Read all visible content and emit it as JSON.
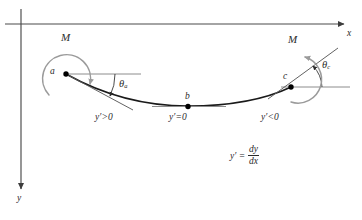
{
  "figure": {
    "background_color": "#ffffff",
    "width": 362,
    "height": 220
  },
  "colors": {
    "axis": "#4a4a4a",
    "curve": "#1a1a1a",
    "moment_arc": "#9b9b9b",
    "reference_line": "#8c8c8c",
    "tangent_line": "#5a5a5a",
    "point": "#000000",
    "text": "#2b2b2b"
  },
  "axes": {
    "x_axis_label": "x",
    "y_axis_label": "y",
    "x_axis_y": 24,
    "y_axis_x": 21,
    "x_arrow_x": 345,
    "y_arrow_y": 190
  },
  "points": [
    {
      "id": "a",
      "label": "a",
      "x": 66,
      "y": 74,
      "slope_sign": "positive"
    },
    {
      "id": "b",
      "label": "b",
      "x": 188,
      "y": 106,
      "slope_sign": "zero"
    },
    {
      "id": "c",
      "label": "c",
      "x": 291,
      "y": 87,
      "slope_sign": "negative"
    }
  ],
  "moments": [
    {
      "id": "moment-a",
      "label": "M",
      "at_point": "a",
      "direction": "clockwise",
      "label_x": 61,
      "label_y": 32
    },
    {
      "id": "moment-c",
      "label": "M",
      "at_point": "c",
      "direction": "counterclockwise",
      "label_x": 288,
      "label_y": 39
    }
  ],
  "angles": [
    {
      "id": "theta-a",
      "symbol": "θ",
      "subscript": "a",
      "at_point": "a",
      "label_x": 120,
      "label_y": 80
    },
    {
      "id": "theta-c",
      "symbol": "θ",
      "subscript": "c",
      "at_point": "c",
      "label_x": 323,
      "label_y": 61
    }
  ],
  "slope_labels": [
    {
      "id": "slope-left",
      "symbol": "y",
      "prime": "′",
      "relation": ">0",
      "text": "y′>0",
      "x": 95,
      "y": 113
    },
    {
      "id": "slope-center",
      "symbol": "y",
      "prime": "′",
      "relation": "=0",
      "text": "y′=0",
      "x": 170,
      "y": 113
    },
    {
      "id": "slope-right",
      "symbol": "y",
      "prime": "′",
      "relation": "<0",
      "text": "y′<0",
      "x": 262,
      "y": 113
    }
  ],
  "equation": {
    "id": "slope-definition",
    "lhs": "y′ =",
    "numerator": "dy",
    "denominator": "dx",
    "full_text": "y′ = dy/dx",
    "x": 230,
    "y": 152
  },
  "curve": {
    "type": "deflection-curve",
    "description": "concave-up sagging beam elastic curve through a, b, c",
    "path": "M 66,74 C 100,93 140,106 188,106 C 232,106 266,99 291,87"
  }
}
